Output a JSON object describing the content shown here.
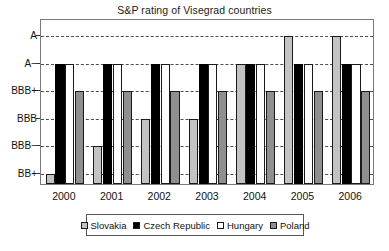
{
  "chart_data": {
    "type": "bar",
    "title": "S&P rating of Visegrad countries",
    "xlabel": "",
    "ylabel": "",
    "grid": true,
    "legend_position": "bottom",
    "categories": [
      "2000",
      "2001",
      "2002",
      "2003",
      "2004",
      "2005",
      "2006"
    ],
    "ytick_labels": [
      "A",
      "A−",
      "BBB+",
      "BBB",
      "BBB−",
      "BB+"
    ],
    "yscale_ordinal": [
      "BB+",
      "BBB−",
      "BBB",
      "BBB+",
      "A−",
      "A"
    ],
    "series": [
      {
        "name": "Slovakia",
        "color": "#c3c3c3",
        "values": [
          "BB+",
          "BBB−",
          "BBB",
          "BBB",
          "A−",
          "A",
          "A"
        ]
      },
      {
        "name": "Czech Republic",
        "color": "#000000",
        "values": [
          "A−",
          "A−",
          "A−",
          "A−",
          "A−",
          "A−",
          "A−"
        ]
      },
      {
        "name": "Hungary",
        "color": "#ffffff",
        "values": [
          "A−",
          "A−",
          "A−",
          "A−",
          "A−",
          "A−",
          "A−"
        ]
      },
      {
        "name": "Poland",
        "color": "#8f8f8f",
        "values": [
          "BBB+",
          "BBB+",
          "BBB+",
          "BBB+",
          "BBB+",
          "BBB+",
          "BBB+"
        ]
      }
    ]
  },
  "legend": {
    "items": [
      {
        "label": "Slovakia",
        "swatch": "slovakia"
      },
      {
        "label": "Czech Republic",
        "swatch": "czech"
      },
      {
        "label": "Hungary",
        "swatch": "hungary"
      },
      {
        "label": "Poland",
        "swatch": "poland"
      }
    ]
  },
  "colors": {
    "frame": "#7a7a7a",
    "gridline": "#4d4d4d",
    "text": "#111111",
    "background": "#ffffff"
  }
}
